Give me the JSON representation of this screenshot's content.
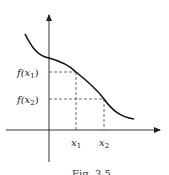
{
  "figure": {
    "type": "function-graph",
    "labels": {
      "fx1": "f(x",
      "fx1_sub": "1",
      "fx1_close": ")",
      "fx2": "f(x",
      "fx2_sub": "2",
      "fx2_close": ")",
      "x1": "x",
      "x1_sub": "1",
      "x2": "x",
      "x2_sub": "2"
    },
    "caption": "Fig. 3.5",
    "colors": {
      "curve": "#111111",
      "axis": "#333333",
      "dashed": "#444444"
    }
  }
}
